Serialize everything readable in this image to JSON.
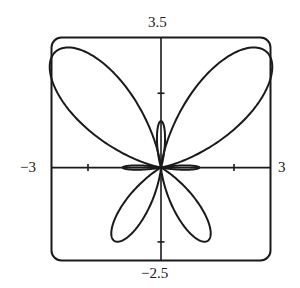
{
  "chart_data": {
    "type": "line",
    "subtype": "polar-curve",
    "title": "",
    "xlabel": "",
    "ylabel": "",
    "xlim": [
      -3,
      3
    ],
    "ylim": [
      -2.5,
      3.5
    ],
    "grid": false,
    "legend": null,
    "x_ticks": [
      -2,
      2
    ],
    "y_ticks": [
      -2,
      2
    ],
    "range_labels": {
      "top": "3.5",
      "bottom": "−2.5",
      "left": "−3",
      "right": "3"
    },
    "petals": [
      {
        "name": "upper-left",
        "angle_deg": 133,
        "length": 4.25,
        "half_width_deg": 17
      },
      {
        "name": "upper-right",
        "angle_deg": 47,
        "length": 4.25,
        "half_width_deg": 17
      },
      {
        "name": "lower-left",
        "angle_deg": 237,
        "length": 2.35,
        "half_width_deg": 13
      },
      {
        "name": "lower-right",
        "angle_deg": 303,
        "length": 2.35,
        "half_width_deg": 13
      },
      {
        "name": "top-small",
        "angle_deg": 90,
        "length": 1.25,
        "half_width_deg": 8
      },
      {
        "name": "left-small",
        "angle_deg": 180,
        "length": 1.05,
        "half_width_deg": 5
      },
      {
        "name": "right-small",
        "angle_deg": 0,
        "length": 1.05,
        "half_width_deg": 5
      }
    ]
  },
  "labels": {
    "top": "3.5",
    "bottom": "−2.5",
    "left": "−3",
    "right": "3"
  },
  "colors": {
    "curve": "#1a1a1a",
    "axis": "#1a1a1a",
    "frame": "#1a1a1a"
  }
}
